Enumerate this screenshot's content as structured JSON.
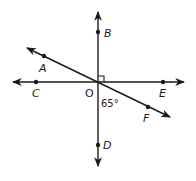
{
  "diagram": {
    "title": "",
    "center_point": "O",
    "points": {
      "A": {
        "label": "A",
        "x": 44,
        "y": 56
      },
      "B": {
        "label": "B",
        "x": 98,
        "y": 32
      },
      "C": {
        "label": "C",
        "x": 36,
        "y": 82
      },
      "D": {
        "label": "D",
        "x": 98,
        "y": 145
      },
      "E": {
        "label": "E",
        "x": 163,
        "y": 82
      },
      "F": {
        "label": "F",
        "x": 148,
        "y": 107
      },
      "O": {
        "label": "O",
        "x": 98,
        "y": 82
      }
    },
    "lines": [
      {
        "name": "line-BD",
        "through": [
          "B",
          "O",
          "D"
        ],
        "orientation": "vertical"
      },
      {
        "name": "line-CE",
        "through": [
          "C",
          "O",
          "E"
        ],
        "orientation": "horizontal"
      },
      {
        "name": "line-AF",
        "through": [
          "A",
          "O",
          "F"
        ],
        "orientation": "diagonal"
      }
    ],
    "angle_marks": [
      {
        "type": "right-angle",
        "at": "O",
        "between": [
          "B",
          "E"
        ]
      },
      {
        "type": "measure",
        "at": "O",
        "between": [
          "D",
          "F"
        ],
        "label": "65°"
      }
    ],
    "labels": {
      "A": "A",
      "B": "B",
      "C": "C",
      "D": "D",
      "E": "E",
      "F": "F",
      "O": "O",
      "angle_DOF": "65°"
    },
    "colors": {
      "stroke": "#1a1a1a",
      "background": "#ffffff"
    }
  }
}
